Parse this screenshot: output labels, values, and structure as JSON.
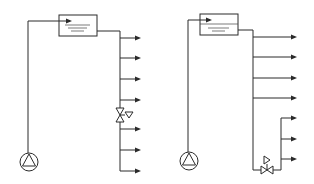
{
  "figure": {
    "colors": {
      "line": "#2a2a2a",
      "background": "#ffffff"
    }
  },
  "diagrams": [
    {
      "id": "left",
      "components": [
        "pump",
        "elevated-tank",
        "single-riser",
        "in-line-valve"
      ],
      "outlet_branches": 7,
      "valve_position": "on main riser between 3rd and 4th branch"
    },
    {
      "id": "right",
      "components": [
        "pump",
        "elevated-tank",
        "main-riser",
        "secondary-riser",
        "bottom-valve"
      ],
      "outlet_branches_main": 4,
      "outlet_branches_secondary": 3,
      "valve_position": "on bottom connecting pipe to secondary riser"
    }
  ]
}
